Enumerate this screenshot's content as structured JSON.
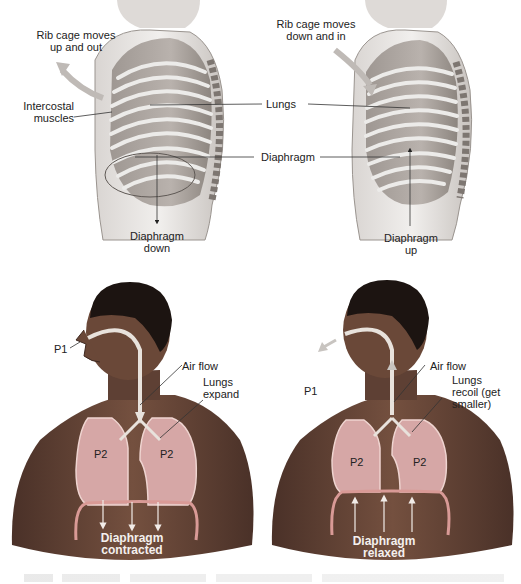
{
  "figure": {
    "top_left": {
      "title": "Inhalation - rib cage",
      "labels": {
        "rib_cage": [
          "Rib cage moves",
          "up and out"
        ],
        "intercostal": [
          "Intercostal",
          "muscles"
        ],
        "diaphragm_dir": [
          "Diaphragm",
          "down"
        ]
      }
    },
    "top_right": {
      "title": "Exhalation - rib cage",
      "labels": {
        "rib_cage": [
          "Rib cage moves",
          "down and in"
        ],
        "diaphragm_dir": [
          "Diaphragm",
          "up"
        ]
      }
    },
    "shared_labels": {
      "lungs": "Lungs",
      "diaphragm": "Diaphragm"
    },
    "bottom_left": {
      "labels": {
        "p1": "P1",
        "air_flow": "Air flow",
        "lungs_state": [
          "Lungs",
          "expand"
        ],
        "p2_left": "P2",
        "p2_right": "P2",
        "diaphragm_state": [
          "Diaphragm",
          "contracted"
        ]
      }
    },
    "bottom_right": {
      "labels": {
        "p1": "P1",
        "air_flow": "Air flow",
        "lungs_state": [
          "Lungs",
          "recoil (get",
          "smaller)"
        ],
        "p2_left": "P2",
        "p2_right": "P2",
        "diaphragm_state": [
          "Diaphragm",
          "relaxed"
        ]
      }
    },
    "colors": {
      "skin": "#6e4b3c",
      "skin_dark": "#3f2a22",
      "hair": "#1c1411",
      "lungs": "#d6a7a6",
      "lung_outline": "#efd4d0",
      "diaphragm": "#d99a96",
      "ribcage": "#c9c4c0",
      "ribcage_dark": "#8e8783",
      "airway": "#e8e2dc",
      "arrow_fill": "#c8c4c0"
    }
  }
}
